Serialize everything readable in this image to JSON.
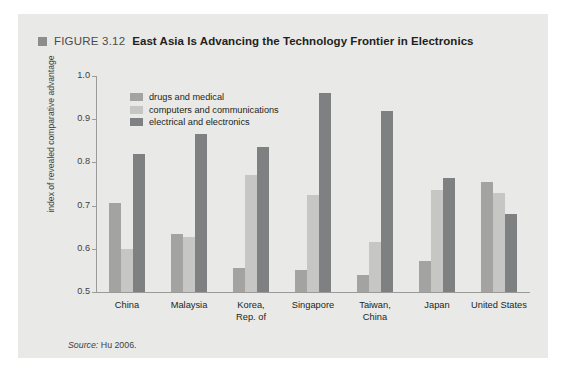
{
  "figure": {
    "marker_icon": "square-marker-icon",
    "number": "FIGURE 3.12",
    "title": "East Asia Is Advancing the Technology Frontier in Electronics",
    "source_prefix": "Source:",
    "source_text": " Hu 2006."
  },
  "colors": {
    "panel_background": "#e9e9e7",
    "series_drugs_and_medical": "#a3a3a1",
    "series_computers_and_communications": "#c6c6c4",
    "series_electrical_and_electronics": "#7e8082",
    "axis": "#9a9a98",
    "text": "#231f20"
  },
  "chart_data": {
    "type": "bar",
    "title": "East Asia Is Advancing the Technology Frontier in Electronics",
    "xlabel": "",
    "ylabel": "index of revealed comparative advantage",
    "ylim": [
      0.5,
      1.0
    ],
    "yticks": [
      "0.5",
      "0.6",
      "0.7",
      "0.8",
      "0.9",
      "1.0"
    ],
    "grid": false,
    "legend_position": "top-left-inside",
    "categories": [
      "China",
      "Malaysia",
      "Korea,\nRep. of",
      "Singapore",
      "Taiwan,\nChina",
      "Japan",
      "United States"
    ],
    "series": [
      {
        "name": "drugs and medical",
        "color": "#a3a3a1",
        "values": [
          0.705,
          0.635,
          0.555,
          0.55,
          0.54,
          0.572,
          0.755
        ]
      },
      {
        "name": "computers and communications",
        "color": "#c6c6c4",
        "values": [
          0.6,
          0.628,
          0.77,
          0.725,
          0.615,
          0.735,
          0.73
        ]
      },
      {
        "name": "electrical and electronics",
        "color": "#7e8082",
        "values": [
          0.82,
          0.865,
          0.835,
          0.96,
          0.92,
          0.765,
          0.68
        ]
      }
    ]
  }
}
